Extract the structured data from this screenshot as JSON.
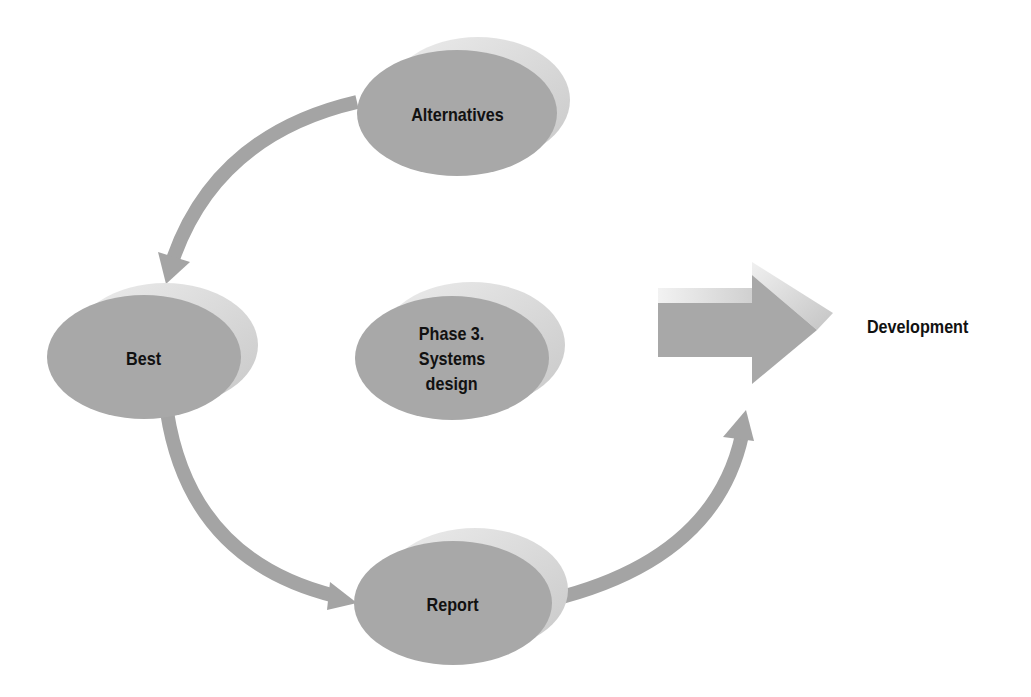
{
  "diagram": {
    "colors": {
      "node_fill": "#a8a8a8",
      "node_shadow": "#d6d6d6",
      "arrow_fill": "#a4a4a4",
      "text": "#111111",
      "background": "#ffffff"
    },
    "nodes": [
      {
        "id": "alternatives",
        "label": "Alternatives"
      },
      {
        "id": "best",
        "label": "Best"
      },
      {
        "id": "center",
        "label_lines": [
          "Phase 3.",
          "Systems",
          "design"
        ]
      },
      {
        "id": "report",
        "label": "Report"
      }
    ],
    "edges": [
      {
        "from": "alternatives",
        "to": "best"
      },
      {
        "from": "best",
        "to": "report"
      },
      {
        "from": "report",
        "to": "development"
      }
    ],
    "output": {
      "label": "Development"
    }
  }
}
